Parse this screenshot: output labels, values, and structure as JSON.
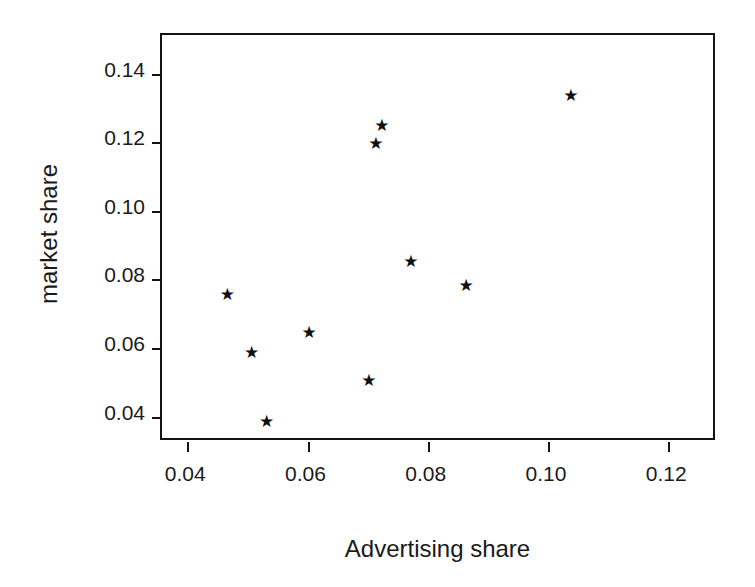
{
  "chart_data": {
    "type": "scatter",
    "title": "",
    "xlabel": "Advertising share",
    "ylabel": "market share",
    "xlim": [
      0.0358,
      0.1281
    ],
    "ylim": [
      0.0326,
      0.1513
    ],
    "xticks": [
      0.04,
      0.06,
      0.08,
      0.1,
      0.12
    ],
    "xtick_labels": [
      "0.04",
      "0.06",
      "0.08",
      "0.10",
      "0.12"
    ],
    "yticks": [
      0.04,
      0.06,
      0.08,
      0.1,
      0.12,
      0.14
    ],
    "ytick_labels": [
      "0.04",
      "0.06",
      "0.08",
      "0.10",
      "0.12",
      "0.14"
    ],
    "grid": false,
    "legend": null,
    "marker": "star",
    "marker_glyph": "★",
    "marker_color": "#111111",
    "points": [
      {
        "x": 0.0465,
        "y": 0.0757
      },
      {
        "x": 0.0505,
        "y": 0.0587
      },
      {
        "x": 0.053,
        "y": 0.0386
      },
      {
        "x": 0.0601,
        "y": 0.0645
      },
      {
        "x": 0.07,
        "y": 0.0506
      },
      {
        "x": 0.0722,
        "y": 0.1249
      },
      {
        "x": 0.0712,
        "y": 0.1196
      },
      {
        "x": 0.077,
        "y": 0.0852
      },
      {
        "x": 0.0862,
        "y": 0.0783
      },
      {
        "x": 0.1036,
        "y": 0.1338
      }
    ]
  },
  "figure": {
    "background": "#ffffff",
    "axis_color": "#141414"
  }
}
